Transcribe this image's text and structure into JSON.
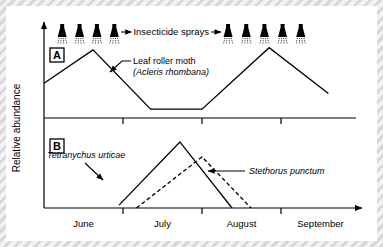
{
  "figure": {
    "y_axis_label": "Relative abundance",
    "spray_label": "Insecticide sprays",
    "panels": [
      {
        "id": "A",
        "label": "A"
      },
      {
        "id": "B",
        "label": "B"
      }
    ],
    "annotations": [
      {
        "name": "leaf-roller-moth",
        "line1": "Leaf roller moth",
        "line2": "(Acleris rhombana)"
      },
      {
        "name": "tetranychus-urticae",
        "line1": "Tetranychus urticae"
      },
      {
        "name": "stethorus-punctum",
        "line1": "Stethorus punctum"
      }
    ]
  },
  "chart_data": {
    "type": "line",
    "title": "",
    "xlabel": "",
    "ylabel": "Relative abundance",
    "grid": false,
    "legend": "inline-annotations",
    "x_axis": {
      "tick_labels": [
        "June",
        "July",
        "August",
        "September"
      ],
      "tick_label_positions": [
        0.5,
        1.5,
        2.5,
        3.5
      ],
      "tick_mark_positions": [
        1,
        2,
        3
      ],
      "range": [
        0,
        4
      ],
      "units": "months"
    },
    "y_axis": {
      "range": [
        0,
        1
      ],
      "tick_labels": [],
      "note": "unitless relative abundance, no numeric ticks"
    },
    "insecticide_sprays": {
      "label": "Insecticide sprays",
      "group_left_count": 4,
      "group_right_count": 5,
      "group_left_x": [
        0.23,
        0.45,
        0.67,
        0.89
      ],
      "group_right_x": [
        2.33,
        2.56,
        2.79,
        3.02,
        3.25
      ]
    },
    "panels": [
      {
        "id": "A",
        "label": "A",
        "series": [
          {
            "name": "Leaf roller moth (Acleris rhombana)",
            "style": "solid",
            "x": [
              0.0,
              0.62,
              1.35,
              2.0,
              2.85,
              3.6
            ],
            "y": [
              0.47,
              0.92,
              0.12,
              0.12,
              0.95,
              0.33
            ]
          }
        ]
      },
      {
        "id": "B",
        "label": "B",
        "series": [
          {
            "name": "Tetranychus urticae",
            "style": "solid",
            "x": [
              0.95,
              1.72,
              2.38
            ],
            "y": [
              0.04,
              0.93,
              0.0
            ]
          },
          {
            "name": "Stethorus punctum",
            "style": "dashed",
            "x": [
              1.17,
              2.0,
              2.62
            ],
            "y": [
              0.0,
              0.72,
              0.0
            ]
          }
        ]
      }
    ]
  }
}
